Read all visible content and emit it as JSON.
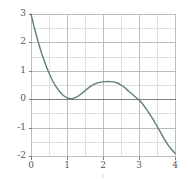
{
  "figure": {
    "background": "#ffffff",
    "plot_frame": {
      "left": 31,
      "top": 14,
      "right": 175,
      "bottom": 156
    },
    "colors": {
      "curve": "#5f7f77",
      "major_grid": "#b9bcc4",
      "minor_grid": "#dcdee3",
      "zero_axis": "#7f7f7f",
      "frame": "#b9bcc4",
      "tick_text": "#555555",
      "caption_text": "#cfcfcf"
    }
  },
  "chart_data": {
    "type": "line",
    "title": "",
    "subtitle": "",
    "xlabel": "t",
    "ylabel": "",
    "xlim": [
      0,
      4
    ],
    "ylim": [
      -2,
      3
    ],
    "grid": true,
    "legend_position": "none",
    "x_ticks": [
      0,
      1,
      2,
      3,
      4
    ],
    "x_tick_labels": [
      "0",
      "1",
      "2",
      "3",
      "4"
    ],
    "y_ticks": [
      -2,
      -1,
      0,
      1,
      2,
      3
    ],
    "y_tick_labels": [
      "-2",
      "-1",
      "0",
      "1",
      "2",
      "3"
    ],
    "x_minor_step": 0.5,
    "y_minor_step": 0.5,
    "series": [
      {
        "name": "curve",
        "color": "#5f7f77",
        "line_width": 1.4,
        "x": [
          0.0,
          0.1,
          0.2,
          0.3,
          0.4,
          0.5,
          0.6,
          0.7,
          0.8,
          0.9,
          1.0,
          1.1,
          1.2,
          1.3,
          1.4,
          1.5,
          1.6,
          1.7,
          1.8,
          1.9,
          2.0,
          2.1,
          2.2,
          2.3,
          2.4,
          2.5,
          2.6,
          2.7,
          2.8,
          2.9,
          3.0,
          3.1,
          3.2,
          3.3,
          3.4,
          3.5,
          3.6,
          3.7,
          3.8,
          3.9,
          4.0
        ],
        "y": [
          3.0,
          2.48,
          2.02,
          1.6,
          1.24,
          0.92,
          0.65,
          0.43,
          0.26,
          0.13,
          0.05,
          0.02,
          0.04,
          0.1,
          0.19,
          0.3,
          0.4,
          0.49,
          0.55,
          0.59,
          0.61,
          0.62,
          0.62,
          0.61,
          0.57,
          0.5,
          0.41,
          0.3,
          0.19,
          0.08,
          -0.03,
          -0.17,
          -0.34,
          -0.53,
          -0.73,
          -0.95,
          -1.17,
          -1.4,
          -1.6,
          -1.76,
          -1.9
        ]
      }
    ],
    "annotations": {
      "local_minimum": {
        "x": 1.0,
        "y": 0.0
      },
      "local_maximum": {
        "x": 2.2,
        "y": 0.62
      },
      "zero_crossing": {
        "x": 3.0,
        "y": 0.0
      },
      "start_point": {
        "x": 0.0,
        "y": 3.0
      },
      "end_point": {
        "x": 4.0,
        "y": -1.9
      }
    }
  }
}
